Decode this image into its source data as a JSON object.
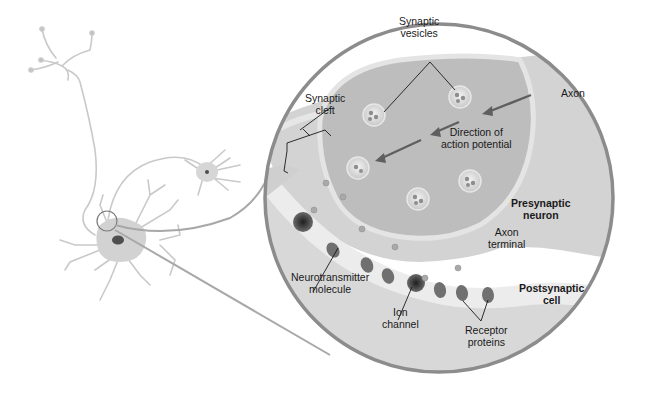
{
  "figure": {
    "labels": {
      "synaptic_vesicles": [
        "Synaptic",
        "vesicles"
      ],
      "synaptic_cleft": [
        "Synaptic",
        "cleft"
      ],
      "axon": [
        "Axon"
      ],
      "direction": [
        "Direction of",
        "action potential"
      ],
      "presynaptic_neuron": [
        "Presynaptic",
        "neuron"
      ],
      "axon_terminal": [
        "Axon",
        "terminal"
      ],
      "postsynaptic_cell": [
        "Postsynaptic",
        "cell"
      ],
      "neurotransmitter": [
        "Neurotransmitter",
        "molecule"
      ],
      "ion_channel": [
        "Ion",
        "channel"
      ],
      "receptor_proteins": [
        "Receptor",
        "proteins"
      ]
    },
    "colors": {
      "circle_border": "#8c8c8c",
      "neuron_fill": "#d2d2d2",
      "terminal_interior": "#b9b9b9",
      "postsynaptic_fill": "#d9d9d9",
      "cleft_fill": "#ececec",
      "protein_fill": "#6e6e6e",
      "arrow": "#5f5f5f"
    }
  }
}
